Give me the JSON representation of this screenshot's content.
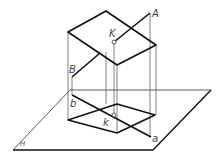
{
  "figure": {
    "title": "",
    "labels": {
      "A": "A",
      "B": "B",
      "K": "K",
      "a": "a",
      "b": "b",
      "k": "k",
      "H": "H"
    },
    "colors": {
      "thick_line": "#111111",
      "thin_line": "#4a4a4a",
      "label": "#444444",
      "background": "#ffffff"
    }
  }
}
